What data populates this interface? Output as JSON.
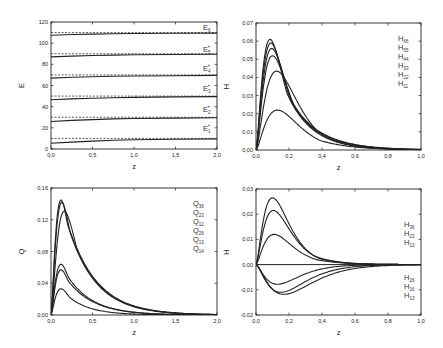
{
  "chart_data": [
    {
      "id": "E",
      "type": "line",
      "box": [
        51,
        22,
        217,
        149
      ],
      "xlim": [
        0,
        2
      ],
      "ylim": [
        0,
        120
      ],
      "xticks": [
        0,
        0.5,
        1.0,
        1.5,
        2.0
      ],
      "xticklabels": [
        "0,0",
        "0,5",
        "1,0",
        "1,5",
        "2,0"
      ],
      "yticks": [
        0,
        20,
        40,
        60,
        80,
        100,
        120
      ],
      "yticklabels": [
        "0",
        "20",
        "40",
        "60",
        "80",
        "100",
        "120"
      ],
      "xlabel": "z",
      "ylabel": "E",
      "legend": [
        {
          "base": "E",
          "sub": "6",
          "sup": ""
        },
        {
          "base": "E",
          "sub": "5",
          "sup": "+"
        },
        {
          "base": "E",
          "sub": "4",
          "sup": "+"
        },
        {
          "base": "E",
          "sub": "3",
          "sup": "+"
        },
        {
          "base": "E",
          "sub": "2",
          "sup": "+"
        },
        {
          "base": "E",
          "sub": "1",
          "sup": "+"
        }
      ],
      "legend_pos": {
        "x": 203,
        "ys": [
          30,
          52,
          71,
          91,
          112,
          131
        ]
      },
      "dashed_levels": [
        10,
        30,
        50,
        70,
        90,
        110
      ],
      "series": [
        {
          "name": "E1",
          "x": [
            0,
            0.25,
            0.5,
            0.75,
            1.0,
            1.5,
            2.0
          ],
          "y": [
            5.5,
            6.5,
            7.5,
            8.2,
            8.7,
            9.2,
            9.5
          ]
        },
        {
          "name": "E2",
          "x": [
            0,
            0.25,
            0.5,
            0.75,
            1.0,
            1.5,
            2.0
          ],
          "y": [
            26,
            27,
            27.8,
            28.4,
            28.8,
            29.2,
            29.5
          ]
        },
        {
          "name": "E3",
          "x": [
            0,
            0.25,
            0.5,
            0.75,
            1.0,
            1.5,
            2.0
          ],
          "y": [
            46.5,
            47.3,
            48,
            48.5,
            48.8,
            49.2,
            49.5
          ]
        },
        {
          "name": "E4",
          "x": [
            0,
            0.25,
            0.5,
            0.75,
            1.0,
            1.5,
            2.0
          ],
          "y": [
            67,
            67.8,
            68.3,
            68.7,
            69,
            69.3,
            69.5
          ]
        },
        {
          "name": "E5",
          "x": [
            0,
            0.25,
            0.5,
            0.75,
            1.0,
            1.5,
            2.0
          ],
          "y": [
            87,
            87.8,
            88.3,
            88.7,
            89,
            89.3,
            89.5
          ]
        },
        {
          "name": "E6",
          "x": [
            0,
            0.25,
            0.5,
            0.75,
            1.0,
            1.5,
            2.0
          ],
          "y": [
            107.5,
            108.2,
            108.6,
            108.9,
            109.1,
            109.3,
            109.5
          ]
        }
      ]
    },
    {
      "id": "H_diag",
      "type": "line",
      "box": [
        256,
        23,
        421,
        150
      ],
      "xlim": [
        0,
        1
      ],
      "ylim": [
        0,
        0.07
      ],
      "xticks": [
        0,
        0.2,
        0.4,
        0.6,
        0.8,
        1.0
      ],
      "xticklabels": [
        "0,0",
        "0,2",
        "0,4",
        "0,6",
        "0,8",
        "1,0"
      ],
      "yticks": [
        0,
        0.01,
        0.02,
        0.03,
        0.04,
        0.05,
        0.06,
        0.07
      ],
      "yticklabels": [
        "0,00",
        "0,01",
        "0,02",
        "0,03",
        "0,04",
        "0,05",
        "0,06",
        "0,07"
      ],
      "xlabel": "z",
      "ylabel": "H",
      "legend": [
        {
          "base": "H",
          "sub": "66",
          "sup": ""
        },
        {
          "base": "H",
          "sub": "55",
          "sup": ""
        },
        {
          "base": "H",
          "sub": "44",
          "sup": ""
        },
        {
          "base": "H",
          "sub": "33",
          "sup": ""
        },
        {
          "base": "H",
          "sub": "22",
          "sup": ""
        },
        {
          "base": "H",
          "sub": "11",
          "sup": ""
        }
      ],
      "legend_pos": {
        "x": 398,
        "ys": [
          41,
          50,
          59,
          68,
          77,
          86
        ]
      },
      "series": [
        {
          "name": "H66",
          "peak": 0.061,
          "xpeak": 0.085,
          "decay": 6.5
        },
        {
          "name": "H55",
          "peak": 0.059,
          "xpeak": 0.09,
          "decay": 6.3
        },
        {
          "name": "H44",
          "peak": 0.056,
          "xpeak": 0.095,
          "decay": 6.0
        },
        {
          "name": "H33",
          "peak": 0.052,
          "xpeak": 0.1,
          "decay": 5.8
        },
        {
          "name": "H22",
          "peak": 0.0435,
          "xpeak": 0.125,
          "decay": 5.6
        },
        {
          "name": "H11",
          "peak": 0.022,
          "xpeak": 0.13,
          "decay": 5.5
        }
      ]
    },
    {
      "id": "Q",
      "type": "line",
      "box": [
        51,
        188,
        217,
        315
      ],
      "xlim": [
        0,
        2
      ],
      "ylim": [
        0,
        0.16
      ],
      "xticks": [
        0,
        0.5,
        1.0,
        1.5,
        2.0
      ],
      "xticklabels": [
        "0,0",
        "0,5",
        "1,0",
        "1,5",
        "2,0"
      ],
      "yticks": [
        0,
        0.04,
        0.08,
        0.12,
        0.16
      ],
      "yticklabels": [
        "0,00",
        "0,04",
        "0,08",
        "0,12",
        "0,16"
      ],
      "xlabel": "z",
      "ylabel": "Q",
      "legend": [
        {
          "base": "Q",
          "sub": "36",
          "sup": ""
        },
        {
          "base": "Q",
          "sub": "23",
          "sup": ""
        },
        {
          "base": "Q",
          "sub": "12",
          "sup": ""
        },
        {
          "base": "Q",
          "sub": "26",
          "sup": ""
        },
        {
          "base": "Q",
          "sub": "13",
          "sup": ""
        },
        {
          "base": "Q",
          "sub": "14",
          "sup": ""
        }
      ],
      "legend_pos": {
        "x": 193,
        "ys": [
          206,
          215,
          224,
          233,
          242,
          251
        ]
      },
      "series": [
        {
          "name": "Q36",
          "peak": 0.145,
          "xpeak": 0.12,
          "decay": 3.0
        },
        {
          "name": "Q23",
          "peak": 0.142,
          "xpeak": 0.13,
          "decay": 2.95
        },
        {
          "name": "Q12",
          "peak": 0.131,
          "xpeak": 0.16,
          "decay": 2.9
        },
        {
          "name": "Q26",
          "peak": 0.064,
          "xpeak": 0.12,
          "decay": 3.3
        },
        {
          "name": "Q13",
          "peak": 0.057,
          "xpeak": 0.12,
          "decay": 3.2
        },
        {
          "name": "Q14",
          "peak": 0.033,
          "xpeak": 0.12,
          "decay": 3.8
        }
      ]
    },
    {
      "id": "H_off",
      "type": "line",
      "box": [
        256,
        189,
        421,
        315
      ],
      "xlim": [
        0,
        1
      ],
      "ylim": [
        -0.02,
        0.03
      ],
      "xticks": [
        0,
        0.2,
        0.4,
        0.6,
        0.8,
        1.0
      ],
      "xticklabels": [
        "0,0",
        "0,2",
        "0,4",
        "0,6",
        "0,8",
        "1,0"
      ],
      "yticks": [
        -0.02,
        -0.01,
        0,
        0.01,
        0.02,
        0.03
      ],
      "yticklabels": [
        "-0,02",
        "-0,01",
        "0,00",
        "0,01",
        "0,02",
        "0,03"
      ],
      "xlabel": "z",
      "ylabel": "H",
      "legend": [
        {
          "base": "H",
          "sub": "36",
          "sup": ""
        },
        {
          "base": "H",
          "sub": "23",
          "sup": ""
        },
        {
          "base": "H",
          "sub": "12",
          "sup": ""
        },
        {
          "base": "H",
          "sub": "26",
          "sup": ""
        },
        {
          "base": "H",
          "sub": "16",
          "sup": ""
        },
        {
          "base": "H",
          "sub": "13",
          "sup": ""
        }
      ],
      "legend_pos": {
        "x": 404,
        "ys": [
          227,
          236,
          245,
          280,
          289,
          298
        ]
      },
      "zero_line": true,
      "series": [
        {
          "name": "H36",
          "peak": 0.0265,
          "xpeak": 0.1,
          "decay": 8.0
        },
        {
          "name": "H23",
          "peak": 0.0215,
          "xpeak": 0.105,
          "decay": 7.8
        },
        {
          "name": "H12",
          "peak": 0.012,
          "xpeak": 0.11,
          "decay": 7.0
        },
        {
          "name": "H26",
          "peak": -0.0078,
          "xpeak": 0.13,
          "decay": 7.0
        },
        {
          "name": "H16",
          "peak": -0.011,
          "xpeak": 0.15,
          "decay": 7.5
        },
        {
          "name": "H13",
          "peak": -0.0118,
          "xpeak": 0.17,
          "decay": 7.5
        }
      ]
    }
  ]
}
